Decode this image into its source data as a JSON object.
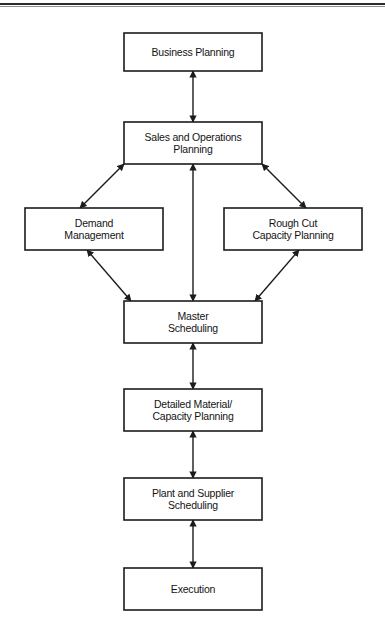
{
  "figure": {
    "caption_clipped": "Figure: Manufacturing Planning and Control System",
    "top_rule_color": "#2b2b2b",
    "box_border_color": "#1c1c1c",
    "box_fill_color": "#ffffff",
    "arrow_color": "#1c1c1c",
    "background_color": "#ffffff"
  },
  "nodes": [
    {
      "id": "business-planning",
      "lines": [
        "Business Planning"
      ],
      "x": 124,
      "y": 33,
      "w": 138,
      "h": 38
    },
    {
      "id": "sales-and-operations-planning",
      "lines": [
        "Sales and Operations",
        "Planning"
      ],
      "x": 124,
      "y": 122,
      "w": 138,
      "h": 42
    },
    {
      "id": "demand-management",
      "lines": [
        "Demand",
        "Management"
      ],
      "x": 25,
      "y": 208,
      "w": 138,
      "h": 42
    },
    {
      "id": "rough-cut-capacity-planning",
      "lines": [
        "Rough Cut",
        "Capacity Planning"
      ],
      "x": 224,
      "y": 208,
      "w": 138,
      "h": 42
    },
    {
      "id": "master-scheduling",
      "lines": [
        "Master",
        "Scheduling"
      ],
      "x": 124,
      "y": 301,
      "w": 138,
      "h": 42
    },
    {
      "id": "detailed-material-capacity-planning",
      "lines": [
        "Detailed Material/",
        "Capacity Planning"
      ],
      "x": 124,
      "y": 389,
      "w": 138,
      "h": 42
    },
    {
      "id": "plant-and-supplier-scheduling",
      "lines": [
        "Plant and Supplier",
        "Scheduling"
      ],
      "x": 124,
      "y": 478,
      "w": 138,
      "h": 42
    },
    {
      "id": "execution",
      "lines": [
        "Execution"
      ],
      "x": 124,
      "y": 568,
      "w": 138,
      "h": 42
    }
  ],
  "connectors": [
    {
      "id": "business-planning--sales-and-operations-planning",
      "from": "business-planning",
      "to": "sales-and-operations-planning",
      "style": "double-headed-vertical",
      "x1": 193,
      "y1": 71,
      "x2": 193,
      "y2": 122
    },
    {
      "id": "sales-and-operations-planning--demand-management",
      "from": "sales-and-operations-planning",
      "to": "demand-management",
      "style": "double-headed-diagonal",
      "x1": 124,
      "y1": 164,
      "x2": 80,
      "y2": 208
    },
    {
      "id": "sales-and-operations-planning--rough-cut-capacity-planning",
      "from": "sales-and-operations-planning",
      "to": "rough-cut-capacity-planning",
      "style": "double-headed-diagonal",
      "x1": 262,
      "y1": 164,
      "x2": 306,
      "y2": 208
    },
    {
      "id": "sales-and-operations-planning--master-scheduling",
      "from": "sales-and-operations-planning",
      "to": "master-scheduling",
      "style": "double-headed-vertical-long",
      "x1": 193,
      "y1": 164,
      "x2": 193,
      "y2": 301
    },
    {
      "id": "demand-management--master-scheduling",
      "from": "demand-management",
      "to": "master-scheduling",
      "style": "double-headed-diagonal",
      "x1": 87,
      "y1": 250,
      "x2": 131,
      "y2": 301
    },
    {
      "id": "rough-cut-capacity-planning--master-scheduling",
      "from": "rough-cut-capacity-planning",
      "to": "master-scheduling",
      "style": "double-headed-diagonal",
      "x1": 299,
      "y1": 250,
      "x2": 255,
      "y2": 301
    },
    {
      "id": "master-scheduling--detailed-material-capacity-planning",
      "from": "master-scheduling",
      "to": "detailed-material-capacity-planning",
      "style": "double-headed-vertical",
      "x1": 193,
      "y1": 343,
      "x2": 193,
      "y2": 389
    },
    {
      "id": "detailed-material-capacity-planning--plant-and-supplier-scheduling",
      "from": "detailed-material-capacity-planning",
      "to": "plant-and-supplier-scheduling",
      "style": "double-headed-vertical",
      "x1": 193,
      "y1": 431,
      "x2": 193,
      "y2": 478
    },
    {
      "id": "plant-and-supplier-scheduling--execution",
      "from": "plant-and-supplier-scheduling",
      "to": "execution",
      "style": "double-headed-vertical",
      "x1": 193,
      "y1": 520,
      "x2": 193,
      "y2": 568
    }
  ]
}
